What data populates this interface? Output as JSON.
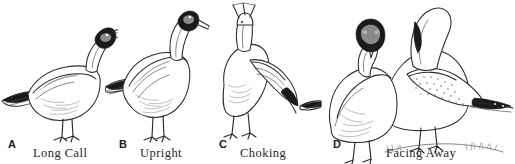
{
  "figure": {
    "type": "illustration-plate",
    "background_color": "#ffffff",
    "ink_color": "#2b2b2b",
    "width": 515,
    "height": 164,
    "panels": [
      {
        "letter": "A",
        "caption": "Long Call",
        "letter_x": 8,
        "letter_y": 138,
        "caption_x": 33,
        "caption_y": 146,
        "art_x": 0,
        "art_width": 118,
        "icon": "gull-long-call-icon",
        "bird_count": 1,
        "posture": "horizontal body, head raised, bill open and angled upward"
      },
      {
        "letter": "B",
        "caption": "Upright",
        "letter_x": 119,
        "letter_y": 138,
        "caption_x": 140,
        "caption_y": 146,
        "art_x": 105,
        "art_width": 105,
        "icon": "gull-upright-icon",
        "bird_count": 1,
        "posture": "erect vertical neck, bill pointed downward and forward"
      },
      {
        "letter": "C",
        "caption": "Choking",
        "letter_x": 219,
        "letter_y": 138,
        "caption_x": 240,
        "caption_y": 146,
        "art_x": 212,
        "art_width": 110,
        "icon": "gull-choking-icon",
        "bird_count": 1,
        "posture": "head lowered to ground, body hunched, tail raised"
      },
      {
        "letter": "D",
        "caption": "Facing Away",
        "letter_x": 333,
        "letter_y": 138,
        "caption_x": 386,
        "caption_y": 146,
        "art_x": 325,
        "art_width": 190,
        "icon": "gull-pair-facing-away-icon",
        "bird_count": 2,
        "posture": "paired birds, one facing viewer and one turning head away"
      }
    ]
  }
}
